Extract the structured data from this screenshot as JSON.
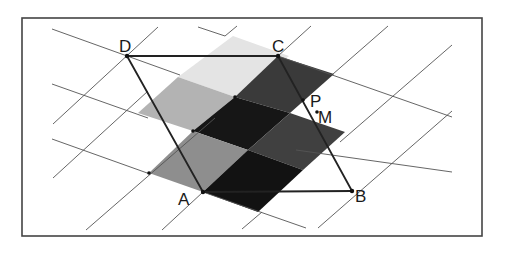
{
  "diagram": {
    "canvas": {
      "width": 509,
      "height": 253,
      "background": "#ffffff"
    },
    "frame": {
      "x": 22,
      "y": 18,
      "width": 460,
      "height": 218,
      "stroke": "#444444",
      "stroke_width": 1.6
    },
    "grid_color": "#555555",
    "grid_lines": [
      {
        "x1": 52,
        "y1": 29,
        "x2": 180,
        "y2": 75
      },
      {
        "x1": 52,
        "y1": 84,
        "x2": 148,
        "y2": 118
      },
      {
        "x1": 52,
        "y1": 139,
        "x2": 150,
        "y2": 174
      },
      {
        "x1": 198,
        "y1": 27,
        "x2": 225,
        "y2": 36
      },
      {
        "x1": 278,
        "y1": 56,
        "x2": 452,
        "y2": 117
      },
      {
        "x1": 296,
        "y1": 150,
        "x2": 452,
        "y2": 172
      },
      {
        "x1": 203,
        "y1": 192,
        "x2": 306,
        "y2": 228
      },
      {
        "x1": 53,
        "y1": 124,
        "x2": 158,
        "y2": 27
      },
      {
        "x1": 53,
        "y1": 178,
        "x2": 148,
        "y2": 91
      },
      {
        "x1": 86,
        "y1": 230,
        "x2": 215,
        "y2": 118
      },
      {
        "x1": 162,
        "y1": 230,
        "x2": 203,
        "y2": 192
      },
      {
        "x1": 225,
        "y1": 36,
        "x2": 237,
        "y2": 26
      },
      {
        "x1": 278,
        "y1": 56,
        "x2": 311,
        "y2": 26
      },
      {
        "x1": 333,
        "y1": 74,
        "x2": 388,
        "y2": 26
      },
      {
        "x1": 340,
        "y1": 142,
        "x2": 452,
        "y2": 45
      },
      {
        "x1": 318,
        "y1": 228,
        "x2": 452,
        "y2": 111
      },
      {
        "x1": 242,
        "y1": 229,
        "x2": 262,
        "y2": 212
      }
    ],
    "tiles": [
      {
        "name": "tile-light",
        "fill": "#e4e4e4",
        "points": "233,36 289,56 235,97 178,77"
      },
      {
        "name": "tile-mid-light-left",
        "fill": "#b3b3b3",
        "points": "178,77 235,97 193,131 138,113"
      },
      {
        "name": "tile-dark-upper-right",
        "fill": "#3a3a3a",
        "points": "278,56 334,74 290,113 235,97"
      },
      {
        "name": "tile-black-center",
        "fill": "#161616",
        "points": "235,97 290,113 248,150 193,131"
      },
      {
        "name": "tile-dark-right",
        "fill": "#404040",
        "points": "290,113 345,132 303,170 248,150"
      },
      {
        "name": "tile-mid-left-lower",
        "fill": "#8e8e8e",
        "points": "193,131 248,150 203,192 149,173"
      },
      {
        "name": "tile-black-bottom",
        "fill": "#121212",
        "points": "248,150 303,170 258,212 203,192"
      }
    ],
    "parallelogram": {
      "stroke": "#222222",
      "stroke_width": 1.8,
      "segments": [
        {
          "name": "side-DC",
          "x1": 127,
          "y1": 56,
          "x2": 278,
          "y2": 56
        },
        {
          "name": "side-CB",
          "x1": 278,
          "y1": 56,
          "x2": 352,
          "y2": 191
        },
        {
          "name": "side-BA",
          "x1": 352,
          "y1": 191,
          "x2": 203,
          "y2": 192
        },
        {
          "name": "side-AD",
          "x1": 203,
          "y1": 192,
          "x2": 127,
          "y2": 56
        }
      ]
    },
    "points": [
      {
        "id": "D",
        "label": "D",
        "x": 127,
        "y": 56,
        "lx": 119,
        "ly": 52
      },
      {
        "id": "C",
        "label": "C",
        "x": 278,
        "y": 56,
        "lx": 272,
        "ly": 52
      },
      {
        "id": "A",
        "label": "A",
        "x": 203,
        "y": 192,
        "lx": 178,
        "ly": 205
      },
      {
        "id": "B",
        "label": "B",
        "x": 352,
        "y": 191,
        "lx": 355,
        "ly": 202
      },
      {
        "id": "P",
        "label": "P",
        "x": 303,
        "y": 100,
        "lx": 310,
        "ly": 107
      },
      {
        "id": "M",
        "label": "M",
        "x": 317,
        "y": 112,
        "lx": 318,
        "ly": 123
      }
    ],
    "vertex_dots": [
      {
        "x": 235,
        "y": 97
      },
      {
        "x": 193,
        "y": 131
      },
      {
        "x": 149,
        "y": 173
      },
      {
        "x": 303,
        "y": 100
      },
      {
        "x": 317,
        "y": 112
      }
    ]
  }
}
